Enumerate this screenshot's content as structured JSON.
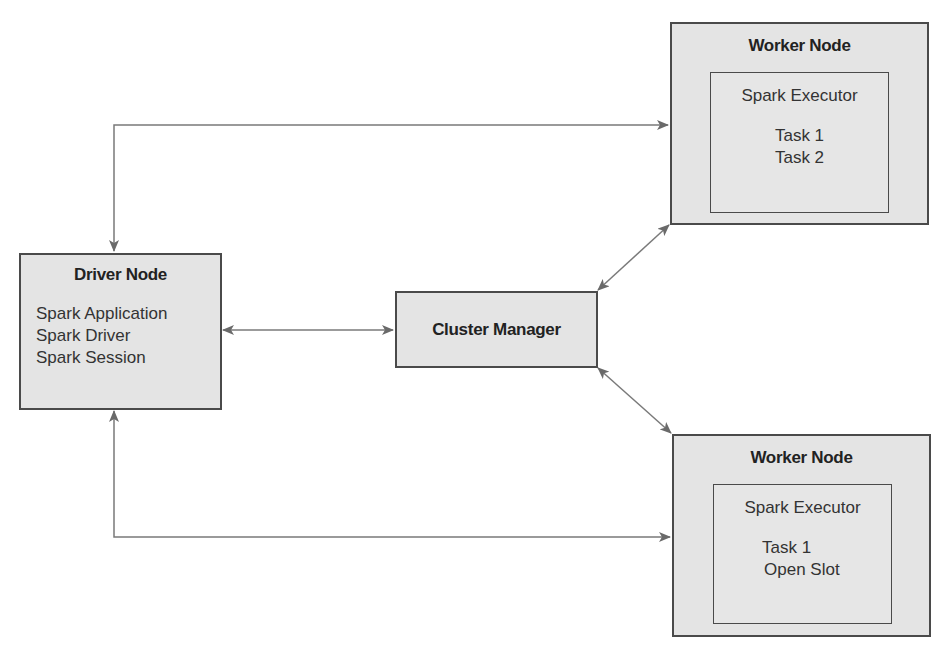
{
  "diagram": {
    "driver_node": {
      "title": "Driver Node",
      "items": [
        "Spark Application",
        "Spark Driver",
        "Spark Session"
      ]
    },
    "cluster_manager": {
      "title": "Cluster Manager"
    },
    "worker_nodes": [
      {
        "title": "Worker Node",
        "executor": {
          "title": "Spark Executor",
          "tasks": [
            "Task 1",
            "Task 2"
          ]
        }
      },
      {
        "title": "Worker Node",
        "executor": {
          "title": "Spark Executor",
          "tasks": [
            "Task 1",
            "Open Slot"
          ]
        }
      }
    ],
    "connections": [
      {
        "from": "driver_node",
        "to": "worker_node_1",
        "type": "bidirectional"
      },
      {
        "from": "driver_node",
        "to": "worker_node_2",
        "type": "bidirectional"
      },
      {
        "from": "driver_node",
        "to": "cluster_manager",
        "type": "bidirectional"
      },
      {
        "from": "cluster_manager",
        "to": "worker_node_1",
        "type": "bidirectional"
      },
      {
        "from": "cluster_manager",
        "to": "worker_node_2",
        "type": "bidirectional"
      }
    ],
    "colors": {
      "box_fill": "#e4e4e4",
      "border": "#4a4a4a",
      "arrow": "#6a6a6a"
    }
  }
}
